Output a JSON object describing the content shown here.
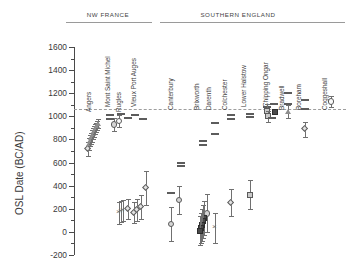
{
  "figure": {
    "y_axis_title": "OSL Date (BC/AD)",
    "group_headers": [
      {
        "text": "NW FRANCE"
      },
      {
        "text": "SOUTHERN  ENGLAND"
      }
    ]
  },
  "chart_data": {
    "type": "scatter",
    "title": "",
    "xlabel": "",
    "ylabel": "OSL Date (BC/AD)",
    "ylim": [
      -200,
      1600
    ],
    "yticks": [
      -200,
      0,
      200,
      400,
      600,
      800,
      1000,
      1200,
      1400,
      1600
    ],
    "ytick_labels": [
      "-200",
      "0",
      "200",
      "400",
      "600",
      "800",
      "1000",
      "1200",
      "1400",
      "1600"
    ],
    "minor_tick_step": 100,
    "grid": false,
    "legend": null,
    "reference_line": {
      "value": 1060,
      "style": "dashed",
      "label": ""
    },
    "groups": [
      {
        "name": "NW FRANCE",
        "sites": [
          "Angers",
          "Mont Saint Michel",
          "Rugles",
          "Vieux Port Auges"
        ]
      },
      {
        "name": "SOUTHERN  ENGLAND",
        "sites": [
          "Canterbury",
          "Brixworth",
          "Darenth",
          "Colchester",
          "Lower Halstow",
          "Chipping Ongar",
          "Bradwell",
          "Boreham",
          "Coggeshall"
        ]
      }
    ],
    "series": [
      {
        "name": "Angers",
        "group": "NW FRANCE",
        "points": [
          {
            "value": 720,
            "err": 60,
            "marker": "diamond"
          },
          {
            "value": 760,
            "err": 55,
            "marker": "tri"
          },
          {
            "value": 790,
            "err": 50,
            "marker": "tri"
          },
          {
            "value": 810,
            "err": 50,
            "marker": "tri"
          },
          {
            "value": 830,
            "err": 48,
            "marker": "tri"
          },
          {
            "value": 850,
            "err": 45,
            "marker": "tri"
          },
          {
            "value": 870,
            "err": 45,
            "marker": "tri"
          },
          {
            "value": 890,
            "err": 42,
            "marker": "tri"
          },
          {
            "value": 905,
            "err": 40,
            "marker": "tri"
          },
          {
            "value": 920,
            "err": 40,
            "marker": "tri"
          },
          {
            "value": 935,
            "err": 38,
            "marker": "tri"
          }
        ]
      },
      {
        "name": "Mont Saint Michel",
        "group": "NW FRANCE",
        "points": [
          {
            "value": 930,
            "err": 55,
            "marker": "circle"
          },
          {
            "value": 960,
            "err": 50,
            "marker": "circle-open"
          },
          {
            "value": 1015,
            "err": 30,
            "marker": "bar"
          },
          {
            "value": 975,
            "err": 0,
            "marker": "bar"
          }
        ]
      },
      {
        "name": "Rugles",
        "group": "NW FRANCE",
        "points": [
          {
            "value": 1020,
            "err": 0,
            "marker": "bar"
          },
          {
            "value": 985,
            "err": 0,
            "marker": "bar"
          },
          {
            "value": 160,
            "err": 95,
            "marker": "cross"
          },
          {
            "value": 175,
            "err": 90,
            "marker": "cross"
          },
          {
            "value": 185,
            "err": 88,
            "marker": "cross"
          },
          {
            "value": 200,
            "err": 85,
            "marker": "diamond"
          }
        ]
      },
      {
        "name": "Vieux Port Auges",
        "group": "NW FRANCE",
        "points": [
          {
            "value": 1015,
            "err": 0,
            "marker": "bar"
          },
          {
            "value": 980,
            "err": 0,
            "marker": "bar"
          },
          {
            "value": 380,
            "err": 150,
            "marker": "diamond"
          },
          {
            "value": 215,
            "err": 105,
            "marker": "diamond"
          },
          {
            "value": 190,
            "err": 95,
            "marker": "diamond"
          },
          {
            "value": 165,
            "err": 90,
            "marker": "diamond"
          }
        ]
      },
      {
        "name": "Canterbury",
        "group": "SOUTHERN ENGLAND",
        "points": [
          {
            "value": 595,
            "err": 0,
            "marker": "bar"
          },
          {
            "value": 570,
            "err": 0,
            "marker": "bar"
          },
          {
            "value": 335,
            "err": 0,
            "marker": "bar"
          },
          {
            "value": 275,
            "err": 120,
            "marker": "circle"
          },
          {
            "value": 70,
            "err": 145,
            "marker": "circle"
          }
        ]
      },
      {
        "name": "Brixworth",
        "group": "SOUTHERN ENGLAND",
        "points": [
          {
            "value": 790,
            "err": 0,
            "marker": "bar"
          },
          {
            "value": 755,
            "err": 0,
            "marker": "bar"
          },
          {
            "value": 160,
            "err": 165,
            "marker": "circle"
          },
          {
            "value": 120,
            "err": 150,
            "marker": "square-dark"
          },
          {
            "value": 90,
            "err": 140,
            "marker": "square-dark"
          },
          {
            "value": 60,
            "err": 135,
            "marker": "square-dark"
          },
          {
            "value": 35,
            "err": 130,
            "marker": "square-dark"
          },
          {
            "value": 10,
            "err": 125,
            "marker": "square-dark"
          }
        ]
      },
      {
        "name": "Darenth",
        "group": "SOUTHERN ENGLAND",
        "points": [
          {
            "value": 945,
            "err": 0,
            "marker": "bar"
          },
          {
            "value": 845,
            "err": 0,
            "marker": "bar"
          },
          {
            "value": 35,
            "err": 130,
            "marker": "cross"
          }
        ]
      },
      {
        "name": "Colchester",
        "group": "SOUTHERN ENGLAND",
        "points": [
          {
            "value": 1015,
            "err": 0,
            "marker": "bar"
          },
          {
            "value": 975,
            "err": 0,
            "marker": "bar"
          },
          {
            "value": 255,
            "err": 115,
            "marker": "diamond"
          }
        ]
      },
      {
        "name": "Lower Halstow",
        "group": "SOUTHERN ENGLAND",
        "points": [
          {
            "value": 1020,
            "err": 0,
            "marker": "bar"
          },
          {
            "value": 990,
            "err": 0,
            "marker": "bar"
          },
          {
            "value": 320,
            "err": 125,
            "marker": "square"
          }
        ]
      },
      {
        "name": "Chipping Ongar",
        "group": "SOUTHERN ENGLAND",
        "points": [
          {
            "value": 1110,
            "err": 0,
            "marker": "bar"
          },
          {
            "value": 1085,
            "err": 0,
            "marker": "bar"
          },
          {
            "value": 1045,
            "err": 60,
            "marker": "square"
          },
          {
            "value": 1040,
            "err": 0,
            "marker": "square-dark"
          },
          {
            "value": 1000,
            "err": 45,
            "marker": "square"
          },
          {
            "value": 985,
            "err": 0,
            "marker": "bar"
          }
        ]
      },
      {
        "name": "Bradwell",
        "group": "SOUTHERN ENGLAND",
        "points": [
          {
            "value": 1205,
            "err": 0,
            "marker": "bar"
          },
          {
            "value": 1105,
            "err": 0,
            "marker": "bar"
          },
          {
            "value": 1040,
            "err": 55,
            "marker": "tri"
          }
        ]
      },
      {
        "name": "Boreham",
        "group": "SOUTHERN ENGLAND",
        "points": [
          {
            "value": 1140,
            "err": 0,
            "marker": "bar"
          },
          {
            "value": 1065,
            "err": 0,
            "marker": "bar"
          },
          {
            "value": 890,
            "err": 65,
            "marker": "diamond"
          }
        ]
      },
      {
        "name": "Coggeshall",
        "group": "SOUTHERN ENGLAND",
        "points": [
          {
            "value": 1130,
            "err": 50,
            "marker": "circle-open"
          }
        ]
      }
    ]
  }
}
